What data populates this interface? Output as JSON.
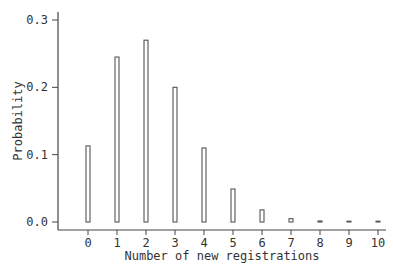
{
  "chart_data": {
    "type": "bar",
    "title": "",
    "xlabel": "Number of new registrations",
    "ylabel": "Probability",
    "categories": [
      "0",
      "1",
      "2",
      "3",
      "4",
      "5",
      "6",
      "7",
      "8",
      "9",
      "10"
    ],
    "values": [
      0.113,
      0.245,
      0.27,
      0.2,
      0.11,
      0.049,
      0.018,
      0.005,
      0.0015,
      0.0005,
      0.0001
    ],
    "ylim": [
      0.0,
      0.3
    ],
    "xlim": [
      -0.5,
      10.5
    ],
    "yticks": [
      "0.0",
      "0.1",
      "0.2",
      "0.3"
    ],
    "ytick_values": [
      0.0,
      0.1,
      0.2,
      0.3
    ],
    "xticks": [
      "0",
      "1",
      "2",
      "3",
      "4",
      "5",
      "6",
      "7",
      "8",
      "9",
      "10"
    ],
    "grid": false,
    "legend": null
  }
}
